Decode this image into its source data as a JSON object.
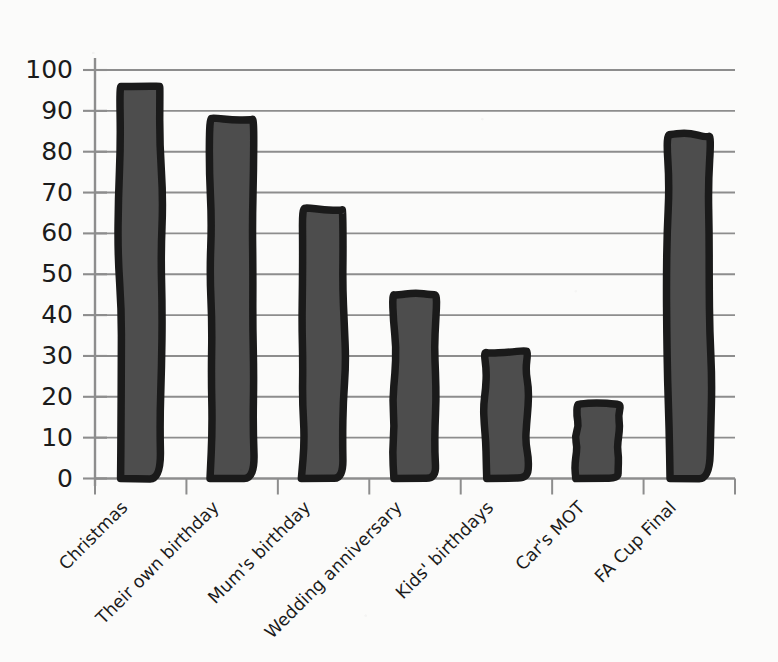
{
  "chart_data": {
    "type": "bar",
    "title": "",
    "subtitle": "",
    "xlabel": "",
    "ylabel": "",
    "categories": [
      "Christmas",
      "Their own birthday",
      "Mum's birthday",
      "Wedding anniversary",
      "Kids' birthdays",
      "Car's MOT",
      "FA Cup Final"
    ],
    "values": [
      96,
      88,
      66,
      45,
      31,
      18,
      84
    ],
    "ylim": [
      0,
      100
    ],
    "ytick_labels": [
      "0",
      "10",
      "20",
      "30",
      "40",
      "50",
      "60",
      "70",
      "80",
      "90",
      "100"
    ],
    "ytick_values": [
      0,
      10,
      20,
      30,
      40,
      50,
      60,
      70,
      80,
      90,
      100
    ],
    "grid": true,
    "grid_axis": "y",
    "legend": false,
    "legend_position": "none",
    "style": "hand-drawn",
    "annotations": []
  },
  "colors": {
    "background": "#fbfbfa",
    "bar_fill": "#4d4d4d",
    "bar_outline": "#1a1a1a",
    "gridline": "#8d8d8d",
    "axis": "#8d8d8d",
    "text": "#1b1b1b"
  },
  "axes": {
    "y_axis_name": "value-axis",
    "x_axis_name": "category-axis"
  }
}
